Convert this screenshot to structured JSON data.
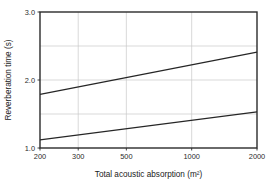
{
  "chart_data": {
    "type": "line",
    "title": "",
    "xlabel": "Total acoustic absorption (m²)",
    "ylabel": "Reverberation time (s)",
    "xscale": "log",
    "yscale": "linear",
    "xlim": [
      200,
      2000
    ],
    "ylim": [
      1.0,
      3.0
    ],
    "xticks": [
      200,
      300,
      500,
      1000,
      2000
    ],
    "xticklabels": [
      "200",
      "300",
      "500",
      "1000",
      "2000"
    ],
    "yticks": [
      1.0,
      2.0,
      3.0
    ],
    "yticklabels": [
      "1.0",
      "2.0",
      "3.0"
    ],
    "ygridlines": [
      1.5,
      2.0,
      2.5
    ],
    "xgridlines": [
      300,
      500,
      1000
    ],
    "grid": true,
    "legend": "none",
    "series": [
      {
        "name": "upper-bound",
        "x": [
          200,
          2000
        ],
        "values": [
          1.79,
          2.41
        ]
      },
      {
        "name": "lower-bound",
        "x": [
          200,
          2000
        ],
        "values": [
          1.12,
          1.53
        ]
      }
    ]
  },
  "colors": {
    "line": "#262626",
    "grid": "#c9c9c9",
    "frame": "#2b2b2b",
    "text": "#1a1a1a",
    "background": "#ffffff"
  }
}
